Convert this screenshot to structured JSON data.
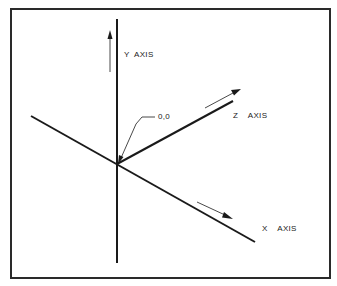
{
  "diagram": {
    "type": "3d-coordinate-axes",
    "labels": {
      "y_axis": "Y  AXIS",
      "z_axis": "Z    AXIS",
      "x_axis": "X    AXIS",
      "origin": "0,0"
    },
    "colors": {
      "line": "#1a1a1a",
      "frame": "#2a2a2a",
      "background": "#ffffff"
    }
  }
}
